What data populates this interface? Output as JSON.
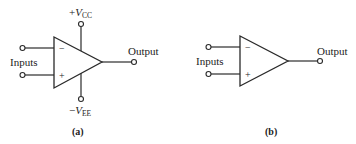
{
  "figure_a": {
    "caption": "(a)",
    "inputs_label": "Inputs",
    "output_label": "Output",
    "inverting_sign": "−",
    "noninverting_sign": "+",
    "vcc": {
      "sign": "+",
      "symbol": "V",
      "subscript": "CC"
    },
    "vee": {
      "sign": "−",
      "symbol": "V",
      "subscript": "EE"
    }
  },
  "figure_b": {
    "caption": "(b)",
    "inputs_label": "Inputs",
    "output_label": "Output",
    "inverting_sign": "−",
    "noninverting_sign": "+"
  },
  "colors": {
    "line": "#2a2a2a",
    "text": "#222222",
    "background": "#ffffff"
  }
}
